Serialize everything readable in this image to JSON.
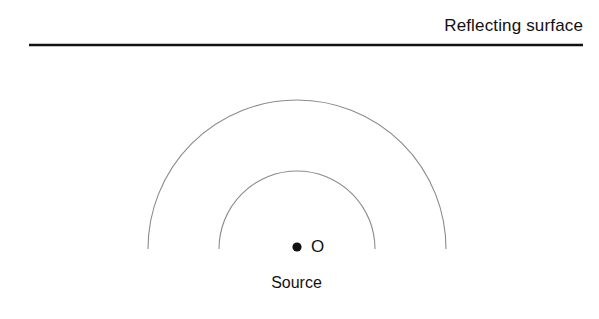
{
  "figure": {
    "background_color": "#ffffff",
    "width": 599,
    "height": 319,
    "labels": {
      "reflecting_surface": "Reflecting surface",
      "origin": "O",
      "source": "Source"
    },
    "colors": {
      "line": "#111111",
      "wavefront": "#8a8a8a",
      "source_dot": "#111111",
      "text": "#111111"
    },
    "reflecting_surface_line": {
      "x1": 29,
      "y1": 45,
      "x2": 583,
      "y2": 45,
      "thickness": 2.6,
      "color": "#111111"
    },
    "source_point": {
      "label": "O",
      "cx": 297,
      "cy": 247,
      "radius": 4.6,
      "color": "#111111"
    },
    "wavefronts": [
      {
        "name": "inner-wavefront",
        "cx": 297,
        "cy": 249,
        "radius": 78,
        "apex_y": 171,
        "left_end_x": 219,
        "right_end_x": 375,
        "stroke": "#8a8a8a",
        "stroke_width": 1.1
      },
      {
        "name": "outer-wavefront",
        "cx": 297,
        "cy": 249,
        "radius": 149,
        "apex_y": 100,
        "left_end_x": 148,
        "right_end_x": 446,
        "stroke": "#8a8a8a",
        "stroke_width": 1.1
      }
    ],
    "clip_bottom_y": 259
  }
}
